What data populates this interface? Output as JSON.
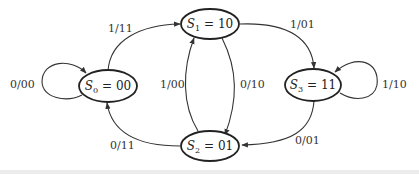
{
  "diagram": {
    "type": "state-diagram",
    "states": [
      {
        "id": "S0",
        "name": "S",
        "sub": "0",
        "value": "00"
      },
      {
        "id": "S1",
        "name": "S",
        "sub": "1",
        "value": "10"
      },
      {
        "id": "S2",
        "name": "S",
        "sub": "2",
        "value": "01"
      },
      {
        "id": "S3",
        "name": "S",
        "sub": "3",
        "value": "11"
      }
    ],
    "transitions": [
      {
        "from": "S0",
        "to": "S0",
        "label": "0/00"
      },
      {
        "from": "S0",
        "to": "S1",
        "label": "1/11"
      },
      {
        "from": "S1",
        "to": "S3",
        "label": "1/01"
      },
      {
        "from": "S1",
        "to": "S2",
        "label": "0/10"
      },
      {
        "from": "S2",
        "to": "S1",
        "label": "1/00"
      },
      {
        "from": "S2",
        "to": "S0",
        "label": "0/11"
      },
      {
        "from": "S3",
        "to": "S3",
        "label": "1/10"
      },
      {
        "from": "S3",
        "to": "S2",
        "label": "0/01"
      }
    ],
    "equals_sign": "="
  }
}
